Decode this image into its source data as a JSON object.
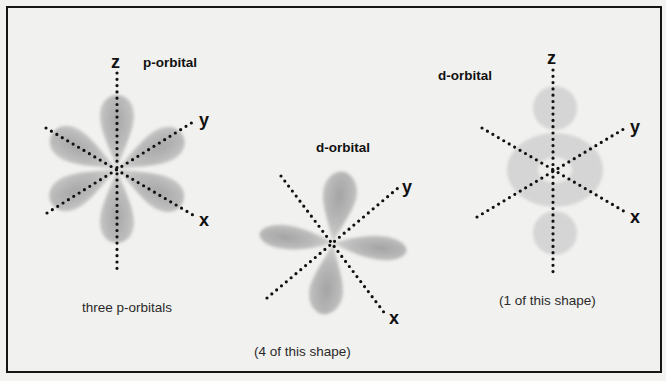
{
  "figure": {
    "background_color": "#f1f1ef",
    "border_color": "#151515",
    "lobe_color": "#a9a9a9",
    "blob_color": "#d6d6d6"
  },
  "panels": [
    {
      "id": "p-orbitals",
      "title": "p-orbital",
      "caption": "three p-orbitals",
      "axes": {
        "z": "z",
        "y": "y",
        "x": "x"
      }
    },
    {
      "id": "d-orbital-cloverleaf",
      "title": "d-orbital",
      "caption": "(4 of this shape)",
      "axes": {
        "y": "y",
        "x": "x"
      }
    },
    {
      "id": "d-orbital-dz2",
      "title": "d-orbital",
      "caption": "(1 of this shape)",
      "axes": {
        "z": "z",
        "y": "y",
        "x": "x"
      }
    }
  ]
}
